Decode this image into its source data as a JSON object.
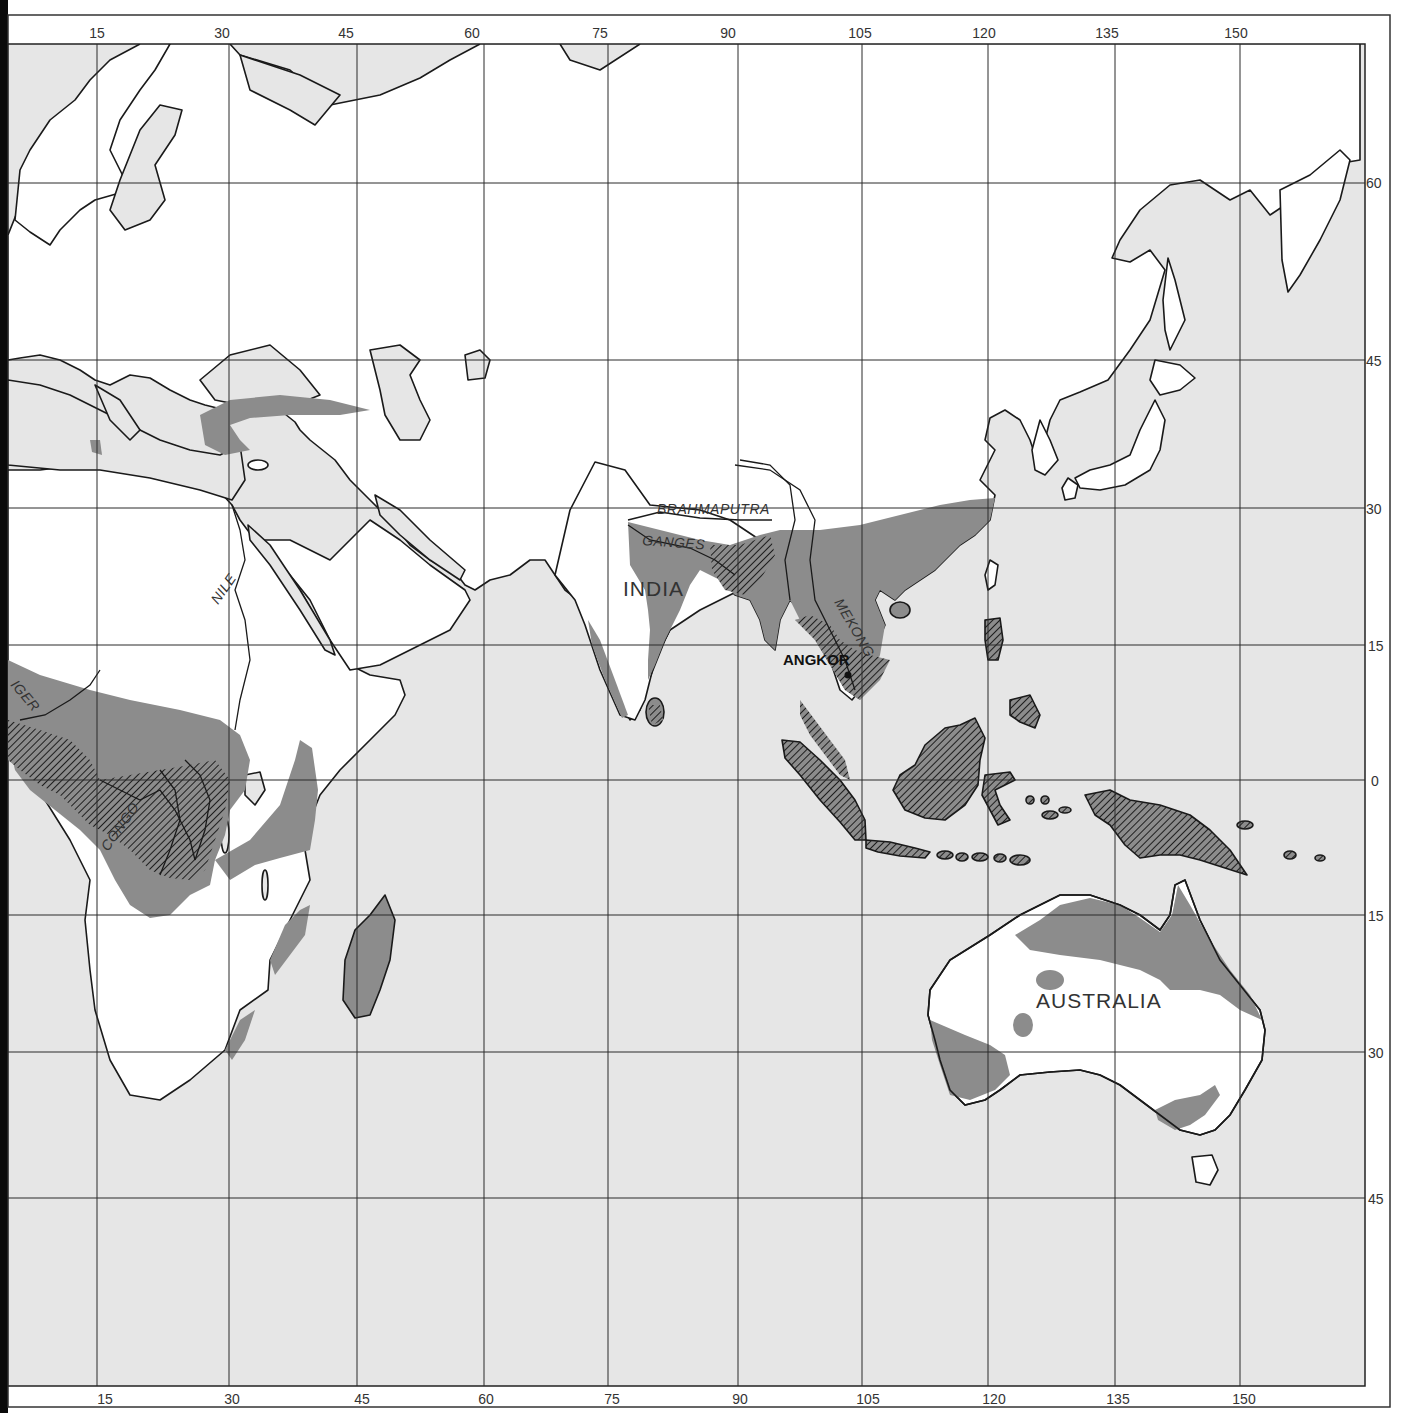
{
  "map": {
    "title": "",
    "colors": {
      "sea": "#e6e6e6",
      "land": "#ffffff",
      "shaded_region": "#8c8c8c",
      "hatched_region": "#5a5a5a",
      "coastline": "#1a1a1a",
      "grid": "#2a2a2a"
    },
    "longitude_labels_top": [
      "15",
      "30",
      "45",
      "60",
      "75",
      "90",
      "105",
      "120",
      "135",
      "150"
    ],
    "longitude_labels_bottom": [
      "15",
      "30",
      "45",
      "60",
      "75",
      "90",
      "105",
      "120",
      "135",
      "150"
    ],
    "latitude_labels_right": [
      "60",
      "45",
      "30",
      "15",
      "0",
      "15",
      "30",
      "45"
    ],
    "region_labels": {
      "india": "INDIA",
      "australia": "AUSTRALIA"
    },
    "site_labels": {
      "angkor": "ANGKOR"
    },
    "river_labels": {
      "brahmaputra": "BRAHMAPUTRA",
      "ganges": "GANGES",
      "mekong": "MEKONG",
      "nile": "NILE",
      "niger": "IGER",
      "congo": "CONGO"
    }
  }
}
